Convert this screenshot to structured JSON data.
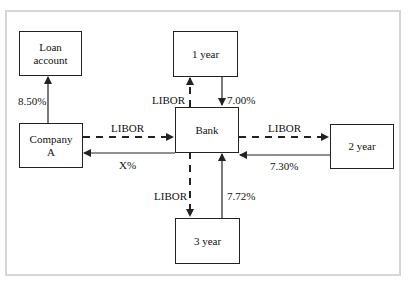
{
  "diagram": {
    "title": "",
    "nodes": {
      "loan_account": {
        "line1": "Loan",
        "line2": "account"
      },
      "company_a": {
        "line1": "Company",
        "line2": "A"
      },
      "bank": {
        "label": "Bank"
      },
      "year1": {
        "label": "1 year"
      },
      "year2": {
        "label": "2 year"
      },
      "year3": {
        "label": "3 year"
      }
    },
    "edges": {
      "company_to_loan": {
        "label": "8.50%",
        "style": "solid"
      },
      "company_to_bank": {
        "label": "LIBOR",
        "style": "dashed"
      },
      "bank_to_company": {
        "label": "X%",
        "style": "solid"
      },
      "bank_to_year1": {
        "label": "LIBOR",
        "style": "dashed"
      },
      "year1_to_bank": {
        "label": "7.00%",
        "style": "solid"
      },
      "bank_to_year2": {
        "label": "LIBOR",
        "style": "dashed"
      },
      "year2_to_bank": {
        "label": "7.30%",
        "style": "solid"
      },
      "bank_to_year3": {
        "label": "LIBOR",
        "style": "dashed"
      },
      "year3_to_bank": {
        "label": "7.72%",
        "style": "solid"
      }
    },
    "colors": {
      "line": "#222222",
      "frame": "#d6d6d6",
      "background": "#ffffff"
    }
  }
}
